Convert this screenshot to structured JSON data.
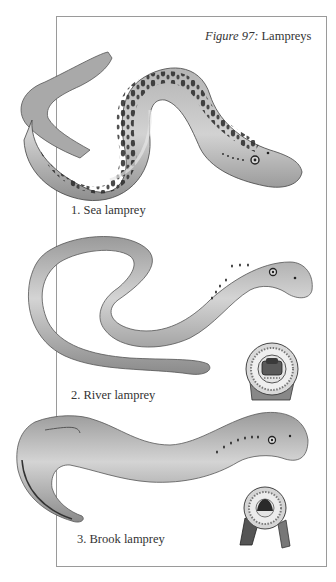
{
  "figure": {
    "number_label": "Figure 97:",
    "title": "Lampreys"
  },
  "plates": [
    {
      "label": "1. Sea lamprey"
    },
    {
      "label": "2. River lamprey"
    },
    {
      "label": "3. Brook lamprey"
    }
  ],
  "colors": {
    "frame_border": "#9a9a9a",
    "body_light": "#c9c9c9",
    "body_mid": "#9d9d9d",
    "body_dark": "#2b2b2b",
    "text": "#333333"
  }
}
